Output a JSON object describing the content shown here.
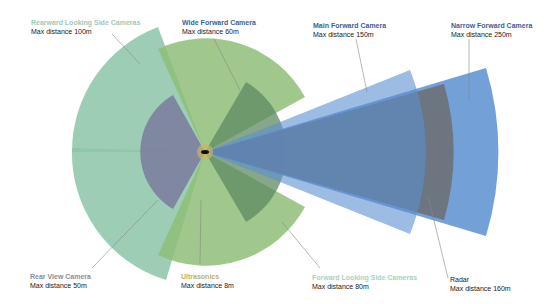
{
  "center": {
    "x": 205,
    "y": 152
  },
  "sensors": [
    {
      "id": "rearward",
      "name": "Rearward Looking Side Cameras",
      "range": "Max distance 100m",
      "color": "#8cc6a8",
      "title_color": "#9fc9b6"
    },
    {
      "id": "wide",
      "name": "Wide Forward Camera",
      "range": "Max distance 60m",
      "color": "#8fbe78",
      "title_color": "#3e5f8f"
    },
    {
      "id": "main",
      "name": "Main Forward Camera",
      "range": "Max distance 150m",
      "color": "#5b8fd0",
      "title_color": "#3e5f8f"
    },
    {
      "id": "narrow",
      "name": "Narrow Forward Camera",
      "range": "Max distance 250m",
      "color": "#5b8fd0",
      "title_color": "#3e5f8f"
    },
    {
      "id": "rearview",
      "name": "Rear View Camera",
      "range": "Max distance 50m",
      "color": "#7a7a9e",
      "title_color": "#8c8c9c"
    },
    {
      "id": "ultrasonics",
      "name": "Ultrasonics",
      "range": "Max distance 8m",
      "color": "#c9b46a",
      "title_color": "#b9b26a"
    },
    {
      "id": "forwardside",
      "name": "Forward Looking Side Cameras",
      "range": "Max distance 80m",
      "color": "#7da86b",
      "title_color": "#a9d2be"
    },
    {
      "id": "radar",
      "name": "Radar",
      "range": "Max distance 160m",
      "color": "#6a6a6a",
      "title_color": "#1a1a1a"
    }
  ]
}
